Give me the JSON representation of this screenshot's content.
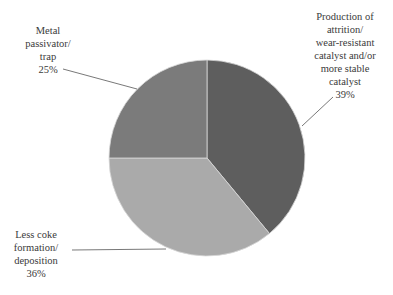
{
  "chart_data": {
    "type": "pie",
    "title": "",
    "start_angle_deg": 90,
    "direction": "clockwise",
    "slices": [
      {
        "label": "Production of attrition/wear-resistant catalyst and/or more stable catalyst",
        "value": 39,
        "display": "39%",
        "color": "#5e5e5e",
        "lines": [
          "Production of",
          "attrition/",
          "wear-resistant",
          "catalyst and/or",
          "more stable",
          "catalyst",
          "39%"
        ]
      },
      {
        "label": "Less coke formation/deposition",
        "value": 36,
        "display": "36%",
        "color": "#aaaaaa",
        "lines": [
          "Less coke",
          "formation/",
          "deposition",
          "36%"
        ]
      },
      {
        "label": "Metal passivator/trap",
        "value": 25,
        "display": "25%",
        "color": "#7b7b7b",
        "lines": [
          "Metal",
          "passivator/",
          "trap",
          "25%"
        ]
      }
    ],
    "legend": "none (callout labels with leader lines)"
  }
}
